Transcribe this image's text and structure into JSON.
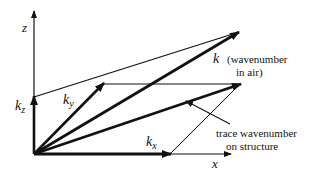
{
  "diagram": {
    "axes": {
      "z_label": "z",
      "x_label": "x"
    },
    "vectors": {
      "k": {
        "symbol": "k",
        "description_line1": "(wavenumber",
        "description_line2": "in air)"
      },
      "kx": {
        "symbol": "k",
        "subscript": "x"
      },
      "ky": {
        "symbol": "k",
        "subscript": "y"
      },
      "kz": {
        "symbol": "k",
        "subscript": "z"
      }
    },
    "annotations": {
      "trace_line1": "trace wavenumber",
      "trace_line2": "on structure"
    },
    "colors": {
      "line": "#111111",
      "background": "#ffffff"
    }
  }
}
